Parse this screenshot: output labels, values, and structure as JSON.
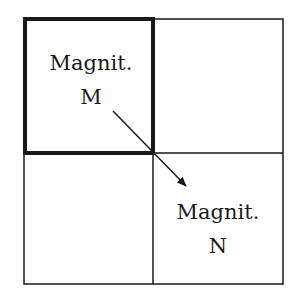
{
  "diagram": {
    "type": "2x2 grid with arrow",
    "cells": [
      {
        "row": 0,
        "col": 0,
        "highlighted": true,
        "label_line1": "Magnit.",
        "label_line2": "M"
      },
      {
        "row": 0,
        "col": 1,
        "highlighted": false,
        "label_line1": "",
        "label_line2": ""
      },
      {
        "row": 1,
        "col": 0,
        "highlighted": false,
        "label_line1": "",
        "label_line2": ""
      },
      {
        "row": 1,
        "col": 1,
        "highlighted": false,
        "label_line1": "Magnit.",
        "label_line2": "N"
      }
    ],
    "arrow": {
      "from": "M",
      "to": "N",
      "direction": "diagonal down-right"
    },
    "colors": {
      "line": "#1a1a1a",
      "background": "#ffffff"
    }
  }
}
